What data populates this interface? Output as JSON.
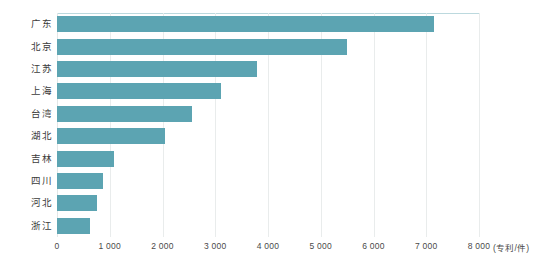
{
  "chart_data": {
    "type": "bar",
    "orientation": "horizontal",
    "title": "",
    "subtitle": "",
    "xlabel": "",
    "ylabel": "",
    "unit_label": "(专利/件)",
    "categories": [
      "广东",
      "北京",
      "江苏",
      "上海",
      "台湾",
      "湖北",
      "吉林",
      "四川",
      "河北",
      "浙江"
    ],
    "values": [
      7150,
      5500,
      3800,
      3100,
      2550,
      2050,
      1080,
      880,
      750,
      630
    ],
    "series": [
      {
        "name": "专利数量",
        "values": [
          7150,
          5500,
          3800,
          3100,
          2550,
          2050,
          1080,
          880,
          750,
          630
        ]
      }
    ],
    "xlim": [
      0,
      8000
    ],
    "xticks": [
      0,
      1000,
      2000,
      3000,
      4000,
      5000,
      6000,
      7000,
      8000
    ],
    "xtick_labels": [
      "0",
      "1 000",
      "2 000",
      "3 000",
      "4 000",
      "5 000",
      "6 000",
      "7 000",
      "8 000"
    ],
    "grid": true,
    "grid_axis": "x",
    "legend": false,
    "legend_position": "none",
    "bar_color": "#5ca4b2",
    "grid_color": "#e9ecec",
    "border_color": "#bcd9de",
    "background_color": "#ffffff",
    "text_color": "#3b3b3b"
  }
}
